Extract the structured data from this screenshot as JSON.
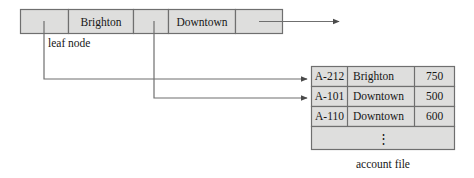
{
  "figure": {
    "caption": "account file",
    "leaf_label": "leaf node",
    "colors": {
      "cell_fill": "#dededd",
      "border": "#6f6f6f",
      "line": "#6f6f6f",
      "text": "#161616",
      "background": "#ffffff"
    }
  },
  "leaf_node": {
    "name": "leaf node",
    "cells": [
      {
        "kind": "pointer",
        "label": ""
      },
      {
        "kind": "key",
        "label": "Brighton"
      },
      {
        "kind": "pointer",
        "label": ""
      },
      {
        "kind": "key",
        "label": "Downtown"
      },
      {
        "kind": "pointer",
        "label": ""
      }
    ]
  },
  "account_file": {
    "title": "account file",
    "columns": [
      "account_number",
      "branch_name",
      "balance"
    ],
    "rows": [
      {
        "account_number": "A-212",
        "branch_name": "Brighton",
        "balance": "750"
      },
      {
        "account_number": "A-101",
        "branch_name": "Downtown",
        "balance": "500"
      },
      {
        "account_number": "A-110",
        "branch_name": "Downtown",
        "balance": "600"
      }
    ],
    "continuation": "⋮"
  },
  "pointers": [
    {
      "from_cell": 0,
      "to_row": 0
    },
    {
      "from_cell": 2,
      "to_row": 1
    },
    {
      "from_cell": 4,
      "to_row": null
    }
  ]
}
